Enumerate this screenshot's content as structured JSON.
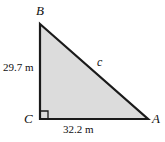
{
  "figure": {
    "type": "right-triangle-diagram",
    "background_color": "#ffffff",
    "fill_color": "#dcdcdc",
    "stroke_color": "#1a1a1a",
    "vertices": {
      "top": "B",
      "bottom_left": "C",
      "bottom_right": "A"
    },
    "sides": {
      "vertical_leg": "29.7 m",
      "horizontal_leg": "32.2 m",
      "hypotenuse": "c"
    },
    "right_angle_at": "C"
  }
}
